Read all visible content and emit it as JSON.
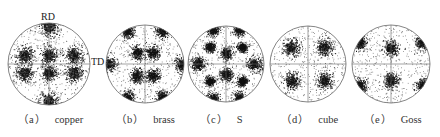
{
  "figure": {
    "axis_labels": {
      "rd": "RD",
      "td": "TD"
    },
    "colors": {
      "ink": "#111111",
      "circle": "#666666",
      "scatter": "#333333"
    },
    "panels": [
      {
        "id": "a",
        "tag": "（a）",
        "name": "copper",
        "cx": 49,
        "cy": 64,
        "r": 41,
        "caption_x": 18,
        "crosshair": true,
        "clusters": [
          [
            0,
            -0.92,
            0.22
          ],
          [
            0,
            0.92,
            0.22
          ],
          [
            -0.6,
            -0.22,
            0.2
          ],
          [
            0,
            -0.22,
            0.18
          ],
          [
            0.6,
            -0.22,
            0.2
          ],
          [
            -0.6,
            0.22,
            0.2
          ],
          [
            0,
            0.22,
            0.18
          ],
          [
            0.6,
            0.22,
            0.2
          ]
        ]
      },
      {
        "id": "b",
        "tag": "（b）",
        "name": "brass",
        "cx": 145,
        "cy": 64,
        "r": 39,
        "caption_x": 118,
        "crosshair": true,
        "clusters": [
          [
            -0.95,
            0,
            0.18
          ],
          [
            0.95,
            0,
            0.18
          ],
          [
            -0.2,
            -0.3,
            0.16
          ],
          [
            0.2,
            -0.3,
            0.16
          ],
          [
            -0.2,
            0.3,
            0.16
          ],
          [
            0.2,
            0.3,
            0.16
          ],
          [
            -0.45,
            -0.85,
            0.16
          ],
          [
            0.45,
            -0.85,
            0.16
          ],
          [
            -0.45,
            0.85,
            0.16
          ],
          [
            0.45,
            0.85,
            0.16
          ]
        ]
      },
      {
        "id": "c",
        "tag": "（c）",
        "name": "S",
        "cx": 226,
        "cy": 64,
        "r": 38,
        "caption_x": 200,
        "crosshair": true,
        "clusters": [
          [
            -0.75,
            0,
            0.18
          ],
          [
            0.75,
            0,
            0.18
          ],
          [
            0,
            -0.28,
            0.15
          ],
          [
            0,
            0.28,
            0.15
          ],
          [
            -0.42,
            -0.45,
            0.12
          ],
          [
            0.42,
            -0.45,
            0.12
          ],
          [
            -0.42,
            0.45,
            0.12
          ],
          [
            0.42,
            0.45,
            0.12
          ],
          [
            -0.35,
            -0.9,
            0.15
          ],
          [
            0.35,
            -0.9,
            0.15
          ],
          [
            -0.35,
            0.9,
            0.15
          ],
          [
            0.35,
            0.9,
            0.15
          ]
        ]
      },
      {
        "id": "d",
        "tag": "（d）",
        "name": "cube",
        "cx": 308,
        "cy": 64,
        "r": 38,
        "caption_x": 283,
        "crosshair": true,
        "clusters": [
          [
            -0.44,
            -0.44,
            0.2
          ],
          [
            0.44,
            -0.44,
            0.2
          ],
          [
            -0.44,
            0.44,
            0.2
          ],
          [
            0.44,
            0.44,
            0.2
          ]
        ]
      },
      {
        "id": "e",
        "tag": "（e）",
        "name": "Goss",
        "cx": 391,
        "cy": 64,
        "r": 39,
        "caption_x": 365,
        "crosshair": true,
        "clusters": [
          [
            0,
            -0.42,
            0.18
          ],
          [
            0,
            0.42,
            0.18
          ],
          [
            -0.8,
            -0.55,
            0.16
          ],
          [
            0.8,
            -0.55,
            0.16
          ],
          [
            -0.8,
            0.55,
            0.16
          ],
          [
            0.8,
            0.55,
            0.16
          ]
        ]
      }
    ]
  }
}
